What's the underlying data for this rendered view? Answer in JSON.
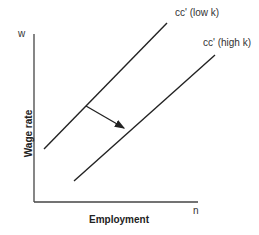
{
  "diagram": {
    "y_axis_symbol": "w",
    "x_axis_symbol": "n",
    "y_axis_label": "Wage rate",
    "x_axis_label": "Employment",
    "curves": [
      {
        "label": "cc' (low k)"
      },
      {
        "label": "cc' (high k)"
      }
    ],
    "arrow": "shift from low k to high k curve",
    "colors": {
      "line": "#222222",
      "axis": "#444444"
    }
  }
}
